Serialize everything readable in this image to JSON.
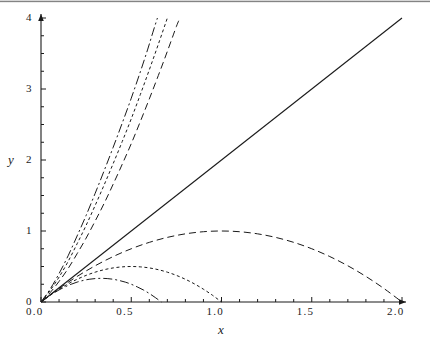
{
  "chart_data": {
    "type": "line",
    "title": "",
    "xlabel": "x",
    "ylabel": "y",
    "xlim": [
      0.0,
      2.0
    ],
    "ylim": [
      0.0,
      4.0
    ],
    "grid": false,
    "legend": "none",
    "xticks": [
      {
        "value": 0.0,
        "label": "0.0"
      },
      {
        "value": 0.5,
        "label": "0.5"
      },
      {
        "value": 1.0,
        "label": "1.0"
      },
      {
        "value": 1.5,
        "label": "1.5"
      },
      {
        "value": 2.0,
        "label": "2.0"
      }
    ],
    "yticks": [
      {
        "value": 0,
        "label": "0"
      },
      {
        "value": 1,
        "label": "1"
      },
      {
        "value": 2,
        "label": "2"
      },
      {
        "value": 3,
        "label": "3"
      },
      {
        "value": 4,
        "label": "4"
      }
    ],
    "x_minor_tick_step": 0.1,
    "y_minor_tick_step": 0.25,
    "axis_arrows": true,
    "series": [
      {
        "name": "straight-line",
        "style": "solid",
        "points": [
          [
            0.0,
            0.0
          ],
          [
            2.0,
            4.0
          ]
        ]
      },
      {
        "name": "rising-curve-1",
        "style": "dash-dot",
        "points": [
          [
            0.0,
            0.0
          ],
          [
            0.05,
            0.18
          ],
          [
            0.1,
            0.4
          ],
          [
            0.15,
            0.65
          ],
          [
            0.2,
            0.93
          ],
          [
            0.25,
            1.22
          ],
          [
            0.3,
            1.53
          ],
          [
            0.35,
            1.85
          ],
          [
            0.4,
            2.18
          ],
          [
            0.45,
            2.52
          ],
          [
            0.5,
            2.87
          ],
          [
            0.55,
            3.24
          ],
          [
            0.59,
            3.55
          ],
          [
            0.62,
            3.8
          ],
          [
            0.645,
            4.0
          ]
        ]
      },
      {
        "name": "rising-curve-2",
        "style": "dotted",
        "points": [
          [
            0.0,
            0.0
          ],
          [
            0.05,
            0.16
          ],
          [
            0.1,
            0.35
          ],
          [
            0.15,
            0.57
          ],
          [
            0.2,
            0.82
          ],
          [
            0.25,
            1.08
          ],
          [
            0.3,
            1.36
          ],
          [
            0.35,
            1.65
          ],
          [
            0.4,
            1.95
          ],
          [
            0.45,
            2.26
          ],
          [
            0.5,
            2.58
          ],
          [
            0.55,
            2.92
          ],
          [
            0.6,
            3.27
          ],
          [
            0.65,
            3.63
          ],
          [
            0.7,
            4.0
          ]
        ]
      },
      {
        "name": "rising-curve-3",
        "style": "dashed",
        "points": [
          [
            0.0,
            0.0
          ],
          [
            0.05,
            0.13
          ],
          [
            0.1,
            0.29
          ],
          [
            0.15,
            0.47
          ],
          [
            0.2,
            0.68
          ],
          [
            0.25,
            0.9
          ],
          [
            0.3,
            1.14
          ],
          [
            0.35,
            1.39
          ],
          [
            0.4,
            1.66
          ],
          [
            0.45,
            1.94
          ],
          [
            0.5,
            2.23
          ],
          [
            0.55,
            2.54
          ],
          [
            0.6,
            2.86
          ],
          [
            0.65,
            3.19
          ],
          [
            0.7,
            3.53
          ],
          [
            0.75,
            3.88
          ],
          [
            0.77,
            4.0
          ]
        ]
      },
      {
        "name": "arch-large",
        "style": "dashed",
        "peak": [
          1.0,
          1.0
        ],
        "x_end": 2.0,
        "points": [
          [
            0.0,
            0.0
          ],
          [
            0.1,
            0.19
          ],
          [
            0.2,
            0.36
          ],
          [
            0.3,
            0.51
          ],
          [
            0.4,
            0.64
          ],
          [
            0.5,
            0.75
          ],
          [
            0.6,
            0.84
          ],
          [
            0.7,
            0.91
          ],
          [
            0.8,
            0.96
          ],
          [
            0.9,
            0.99
          ],
          [
            1.0,
            1.0
          ],
          [
            1.1,
            0.99
          ],
          [
            1.2,
            0.96
          ],
          [
            1.3,
            0.91
          ],
          [
            1.4,
            0.84
          ],
          [
            1.5,
            0.75
          ],
          [
            1.6,
            0.64
          ],
          [
            1.7,
            0.51
          ],
          [
            1.8,
            0.36
          ],
          [
            1.9,
            0.19
          ],
          [
            2.0,
            0.0
          ]
        ]
      },
      {
        "name": "arch-medium",
        "style": "dotted",
        "peak": [
          0.5,
          0.5
        ],
        "x_end": 1.0,
        "points": [
          [
            0.0,
            0.0
          ],
          [
            0.05,
            0.095
          ],
          [
            0.1,
            0.18
          ],
          [
            0.15,
            0.255
          ],
          [
            0.2,
            0.32
          ],
          [
            0.25,
            0.375
          ],
          [
            0.3,
            0.42
          ],
          [
            0.35,
            0.455
          ],
          [
            0.4,
            0.48
          ],
          [
            0.45,
            0.495
          ],
          [
            0.5,
            0.5
          ],
          [
            0.55,
            0.495
          ],
          [
            0.6,
            0.48
          ],
          [
            0.65,
            0.455
          ],
          [
            0.7,
            0.42
          ],
          [
            0.75,
            0.375
          ],
          [
            0.8,
            0.32
          ],
          [
            0.85,
            0.255
          ],
          [
            0.9,
            0.18
          ],
          [
            0.95,
            0.095
          ],
          [
            1.0,
            0.0
          ]
        ]
      },
      {
        "name": "arch-small",
        "style": "dash-dot",
        "peak": [
          0.333,
          0.333
        ],
        "x_end": 0.667,
        "points": [
          [
            0.0,
            0.0
          ],
          [
            0.033,
            0.063
          ],
          [
            0.067,
            0.12
          ],
          [
            0.1,
            0.17
          ],
          [
            0.133,
            0.213
          ],
          [
            0.167,
            0.25
          ],
          [
            0.2,
            0.28
          ],
          [
            0.233,
            0.303
          ],
          [
            0.267,
            0.32
          ],
          [
            0.3,
            0.33
          ],
          [
            0.333,
            0.333
          ],
          [
            0.367,
            0.33
          ],
          [
            0.4,
            0.32
          ],
          [
            0.433,
            0.303
          ],
          [
            0.467,
            0.28
          ],
          [
            0.5,
            0.25
          ],
          [
            0.533,
            0.213
          ],
          [
            0.567,
            0.17
          ],
          [
            0.6,
            0.12
          ],
          [
            0.633,
            0.063
          ],
          [
            0.667,
            0.0
          ]
        ]
      }
    ],
    "colors": {
      "axis": "#1a1a1a",
      "curve": "#1a1a1a",
      "background": "#ffffff"
    }
  }
}
